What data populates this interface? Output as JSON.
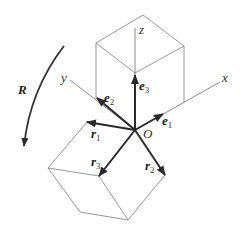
{
  "diagram": {
    "axes": {
      "x": "x",
      "y": "y",
      "z": "z"
    },
    "origin_label": "O",
    "rotation_label": "R",
    "basis_vectors": [
      {
        "base": "e",
        "sub": "1"
      },
      {
        "base": "e",
        "sub": "2"
      },
      {
        "base": "e",
        "sub": "3"
      }
    ],
    "rotated_vectors": [
      {
        "base": "r",
        "sub": "1"
      },
      {
        "base": "r",
        "sub": "2"
      },
      {
        "base": "r",
        "sub": "3"
      }
    ],
    "colors": {
      "vector": "#2a2a2a",
      "edge": "#8a8a8a"
    }
  }
}
